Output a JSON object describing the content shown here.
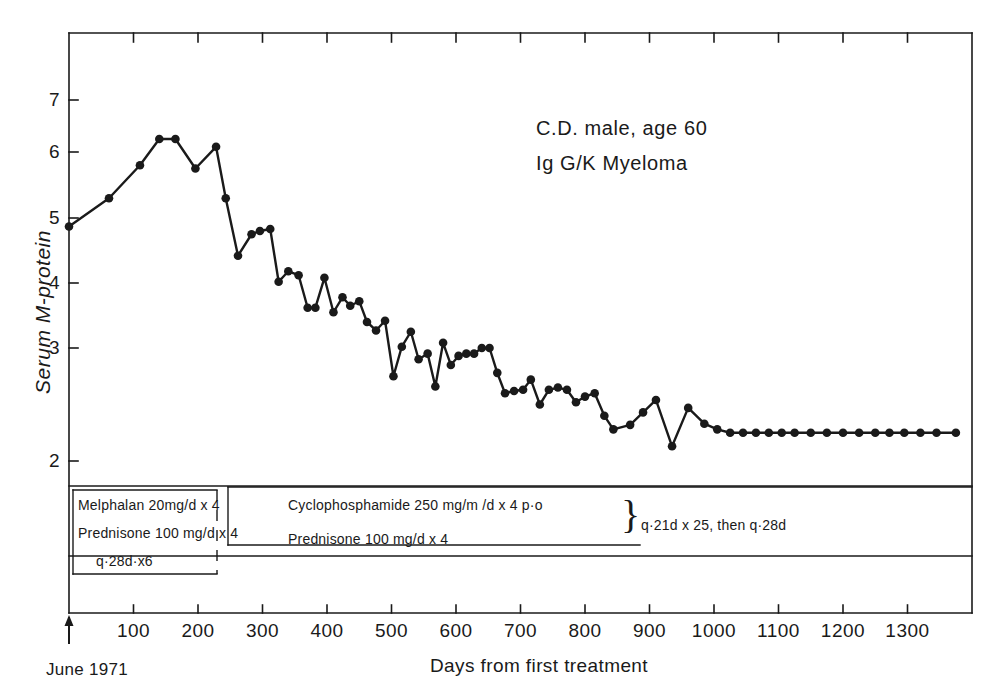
{
  "chart_data": {
    "type": "line",
    "title": "",
    "xlabel": "Days from first treatment",
    "ylabel": "Serum M-protein",
    "xlim": [
      0,
      1400
    ],
    "ylim": [
      1.75,
      7.7
    ],
    "grid": false,
    "legend": "none",
    "xticks": [
      100,
      200,
      300,
      400,
      500,
      600,
      700,
      800,
      900,
      1000,
      1100,
      1200,
      1300
    ],
    "xtick_labels": [
      "100",
      "200",
      "300",
      "400",
      "500",
      "600",
      "700",
      "800",
      "900",
      "1000",
      "1100",
      "1200",
      "1300"
    ],
    "yticks": [
      2,
      3,
      4,
      5,
      6,
      7
    ],
    "ytick_labels": [
      "2",
      "3",
      "4",
      "5",
      "6",
      "7"
    ],
    "y_axis_note": "non-linear: interval between 2 and 3 is expanded relative to upper intervals",
    "marker": "filled-circle",
    "series": [
      {
        "name": "Serum M-protein",
        "x": [
          0,
          62,
          110,
          140,
          165,
          196,
          228,
          243,
          262,
          283,
          296,
          312,
          325,
          340,
          356,
          370,
          382,
          396,
          410,
          424,
          436,
          450,
          462,
          476,
          490,
          503,
          516,
          530,
          542,
          556,
          568,
          580,
          592,
          604,
          616,
          628,
          640,
          652,
          664,
          676,
          690,
          704,
          716,
          730,
          744,
          758,
          772,
          786,
          800,
          815,
          830,
          844,
          870,
          890,
          910,
          935,
          960,
          985,
          1005,
          1025,
          1045,
          1065,
          1085,
          1105,
          1125,
          1150,
          1175,
          1200,
          1225,
          1250,
          1272,
          1295,
          1320,
          1345,
          1375
        ],
        "y": [
          4.87,
          5.3,
          5.8,
          6.25,
          6.25,
          5.75,
          6.1,
          5.3,
          4.42,
          4.75,
          4.8,
          4.83,
          4.02,
          4.18,
          4.12,
          3.62,
          3.62,
          4.08,
          3.55,
          3.78,
          3.65,
          3.72,
          3.4,
          3.27,
          3.42,
          2.75,
          3.02,
          3.25,
          2.9,
          2.95,
          2.66,
          3.08,
          2.85,
          2.93,
          2.95,
          2.95,
          3.0,
          3.0,
          2.78,
          2.6,
          2.62,
          2.63,
          2.72,
          2.5,
          2.63,
          2.65,
          2.63,
          2.52,
          2.57,
          2.6,
          2.4,
          2.28,
          2.32,
          2.43,
          2.54,
          2.13,
          2.47,
          2.33,
          2.28,
          2.25,
          2.25,
          2.25,
          2.25,
          2.25,
          2.25,
          2.25,
          2.25,
          2.25,
          2.25,
          2.25,
          2.25,
          2.25,
          2.25,
          2.25,
          2.25
        ]
      }
    ],
    "annotations": {
      "patient_line_1": "C.D. male, age 60",
      "patient_line_2": "Ig G/K Myeloma",
      "origin_marker": "June 1971"
    }
  },
  "treatment": {
    "regimen_a": {
      "line_1": "Melphalan 20mg/d x 4",
      "line_2": "Prednisone 100 mg/d x 4",
      "line_3": "q·28d·x6"
    },
    "regimen_b": {
      "line_1": "Cyclophosphamide 250 mg/m /d x 4 p·o",
      "line_2": "Prednisone 100 mg/d x 4",
      "schedule": "q·21d x 25, then q·28d",
      "brace": "}"
    }
  },
  "style": {
    "ink": "#1a1a1a",
    "paper": "#ffffff"
  }
}
